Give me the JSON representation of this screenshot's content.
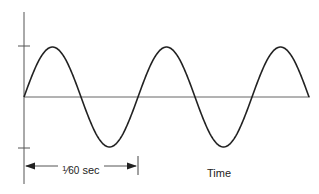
{
  "diagram": {
    "title": "",
    "x_axis_label": "Time",
    "period_annotation": {
      "numerator": "1",
      "slash": "⁄",
      "denominator": "60",
      "unit": "sec",
      "full_text": "1/60 sec"
    },
    "waveform": "sine",
    "cycles_shown": 2.5,
    "amplitude_ticks": [
      "+",
      "-"
    ],
    "colors": {
      "line": "#222222",
      "axis": "#555555",
      "background": "#ffffff"
    }
  }
}
